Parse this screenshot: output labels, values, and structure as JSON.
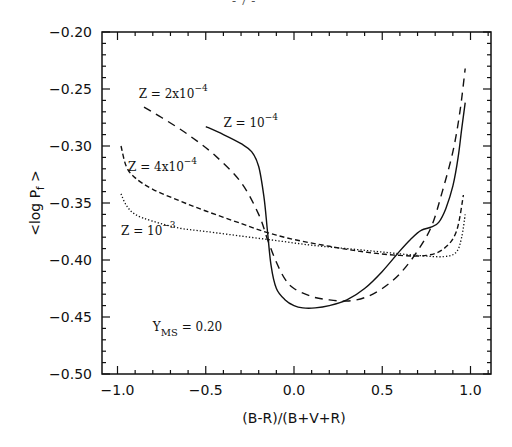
{
  "page_marker": "- 7 -",
  "chart_data": {
    "type": "line",
    "title": "",
    "xlabel": "(B-R)/(B+V+R)",
    "ylabel": "<log P_f>",
    "xlim": [
      -1.09,
      1.11
    ],
    "ylim": [
      -0.5,
      -0.2
    ],
    "x_ticks": [
      -1.0,
      -0.5,
      0.0,
      0.5,
      1.0
    ],
    "x_tick_labels": [
      "-1.0",
      "-0.5",
      "0.0",
      "0.5",
      "1.0"
    ],
    "y_ticks": [
      -0.5,
      -0.45,
      -0.4,
      -0.35,
      -0.3,
      -0.25,
      -0.2
    ],
    "y_tick_labels": [
      "-0.50",
      "-0.45",
      "-0.40",
      "-0.35",
      "-0.30",
      "-0.25",
      "-0.20"
    ],
    "grid": false,
    "legend": "inline annotations",
    "annotations": [
      {
        "text": "Z = 2x10",
        "sup": "-4",
        "x": -0.88,
        "y": -0.258
      },
      {
        "text": "Z = 10",
        "sup": "-4",
        "x": -0.4,
        "y": -0.283
      },
      {
        "text": "Z = 4x10",
        "sup": "-4",
        "x": -0.94,
        "y": -0.322
      },
      {
        "text": "Z = 10",
        "sup": "-3",
        "x": -0.98,
        "y": -0.378
      },
      {
        "text": "Y",
        "sub": "MS",
        "suffix": " = 0.20",
        "x": -0.8,
        "y": -0.462
      }
    ],
    "series": [
      {
        "name": "Z = 10^-4",
        "style": "solid",
        "x": [
          -0.5,
          -0.4,
          -0.3,
          -0.24,
          -0.2,
          -0.17,
          -0.15,
          -0.13,
          -0.1,
          -0.05,
          0.0,
          0.05,
          0.12,
          0.2,
          0.3,
          0.4,
          0.5,
          0.6,
          0.66,
          0.72,
          0.78,
          0.82,
          0.86,
          0.9,
          0.93,
          0.95,
          0.97
        ],
        "y": [
          -0.283,
          -0.29,
          -0.298,
          -0.305,
          -0.318,
          -0.345,
          -0.375,
          -0.405,
          -0.425,
          -0.435,
          -0.44,
          -0.442,
          -0.442,
          -0.44,
          -0.435,
          -0.425,
          -0.41,
          -0.392,
          -0.382,
          -0.374,
          -0.371,
          -0.367,
          -0.355,
          -0.335,
          -0.31,
          -0.285,
          -0.262
        ]
      },
      {
        "name": "Z = 2x10^-4",
        "style": "long-dash",
        "x": [
          -0.85,
          -0.75,
          -0.6,
          -0.45,
          -0.3,
          -0.2,
          -0.15,
          -0.1,
          -0.05,
          0.0,
          0.1,
          0.2,
          0.3,
          0.4,
          0.5,
          0.6,
          0.7,
          0.78,
          0.84,
          0.9,
          0.94,
          0.97
        ],
        "y": [
          -0.266,
          -0.275,
          -0.29,
          -0.308,
          -0.332,
          -0.36,
          -0.382,
          -0.402,
          -0.417,
          -0.425,
          -0.432,
          -0.435,
          -0.436,
          -0.433,
          -0.425,
          -0.412,
          -0.392,
          -0.37,
          -0.34,
          -0.305,
          -0.27,
          -0.232
        ]
      },
      {
        "name": "Z = 4x10^-4",
        "style": "short-dash",
        "x": [
          -0.98,
          -0.95,
          -0.9,
          -0.8,
          -0.65,
          -0.5,
          -0.3,
          -0.15,
          0.0,
          0.2,
          0.4,
          0.6,
          0.75,
          0.85,
          0.92,
          0.96
        ],
        "y": [
          -0.3,
          -0.318,
          -0.328,
          -0.338,
          -0.348,
          -0.357,
          -0.368,
          -0.376,
          -0.382,
          -0.388,
          -0.393,
          -0.396,
          -0.396,
          -0.39,
          -0.375,
          -0.343
        ]
      },
      {
        "name": "Z = 10^-3",
        "style": "dotted",
        "x": [
          -0.98,
          -0.95,
          -0.9,
          -0.8,
          -0.65,
          -0.5,
          -0.3,
          -0.1,
          0.1,
          0.3,
          0.5,
          0.7,
          0.85,
          0.92,
          0.95,
          0.97
        ],
        "y": [
          -0.342,
          -0.352,
          -0.36,
          -0.366,
          -0.372,
          -0.375,
          -0.379,
          -0.383,
          -0.387,
          -0.39,
          -0.393,
          -0.396,
          -0.397,
          -0.393,
          -0.38,
          -0.36
        ]
      }
    ]
  }
}
